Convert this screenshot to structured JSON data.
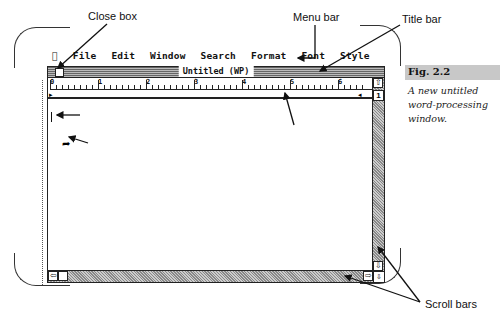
{
  "callouts": {
    "close_box": "Close box",
    "menu_bar": "Menu bar",
    "title_bar": "Title bar",
    "cursor_bar": "Cursor bar (flashes)",
    "arrow": "Arrow (pointer)",
    "ruler": "Ruler",
    "scroll_bars": "Scroll bars"
  },
  "menubar": {
    "apple_icon": "apple-icon",
    "items": [
      "File",
      "Edit",
      "Window",
      "Search",
      "Format",
      "Font",
      "Style"
    ]
  },
  "window": {
    "title": "Untitled (WP)",
    "page_number": "1",
    "ruler_labels": [
      "0",
      "1",
      "2",
      "3",
      "4",
      "5",
      "6"
    ]
  },
  "figure": {
    "label": "Fig. 2.2",
    "caption": "A new untitled word-processing window."
  },
  "colors": {
    "figure_label_bg": "#c8c8c8",
    "scrollbar_fill": "#aaaaaa"
  }
}
